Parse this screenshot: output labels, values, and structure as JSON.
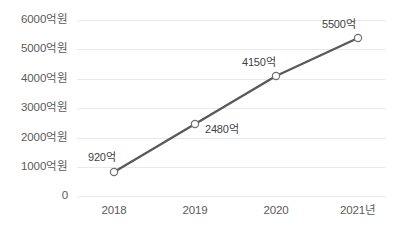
{
  "chart_data": {
    "type": "line",
    "title": "",
    "subtitle": "",
    "xlabel": "",
    "ylabel": "",
    "categories": [
      "2018",
      "2019",
      "2020",
      "2021년"
    ],
    "values": [
      920,
      2480,
      4150,
      5500
    ],
    "point_labels": [
      "920억",
      "2480억",
      "4150억",
      "5500억"
    ],
    "ylim": [
      0,
      6000
    ],
    "ytick_values": [
      0,
      1000,
      2000,
      3000,
      4000,
      5000,
      6000
    ],
    "ytick_labels": [
      "0",
      "1000억원",
      "2000억원",
      "3000억원",
      "4000억원",
      "5000억원",
      "6000억원"
    ],
    "grid": true,
    "grid_axis": "y",
    "legend": false,
    "legend_position": "none",
    "unit_note": "억원",
    "series": [
      {
        "name": "",
        "values": [
          920,
          2480,
          4150,
          5500
        ]
      }
    ],
    "colors": {
      "line": "#595959",
      "marker_fill": "#ffffff",
      "marker_stroke": "#6e6e6e",
      "gridline": "#e9e9e9",
      "tick_text": "#5a5a5a",
      "label_text": "#3f3f3f",
      "background": "#ffffff"
    }
  },
  "geometry": {
    "ytick_y": [
      196,
      167,
      138,
      108,
      79,
      49,
      20
    ],
    "xtick_x": [
      114,
      195,
      276,
      358
    ],
    "point_x": [
      114,
      195,
      276,
      358
    ],
    "point_y": [
      172,
      124,
      76,
      38
    ],
    "grid_left": 77,
    "grid_right": 386,
    "xtick_label_y": 205,
    "point_label_pos": [
      {
        "left": 88,
        "top": 152
      },
      {
        "left": 205,
        "top": 124
      },
      {
        "left": 242,
        "top": 57
      },
      {
        "left": 322,
        "top": 19
      }
    ]
  }
}
